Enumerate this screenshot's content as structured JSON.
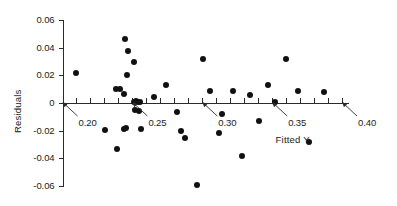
{
  "chart_data": {
    "type": "scatter",
    "title": "",
    "xlabel": "Fitted Y",
    "ylabel": "Residuals",
    "xlim": [
      0.195,
      0.412
    ],
    "ylim": [
      -0.065,
      0.063
    ],
    "grid": false,
    "legend": "none",
    "y_ticks": [
      0.06,
      0.04,
      0.02,
      0,
      -0.02,
      -0.04,
      -0.06
    ],
    "y_tick_labels": [
      "0.06",
      "0.04",
      "0.02",
      "0",
      "-0.02",
      "-0.04",
      "-0.06"
    ],
    "x_tick_step": 0.01,
    "x_ticks": [
      0.2,
      0.21,
      0.22,
      0.23,
      0.24,
      0.25,
      0.26,
      0.27,
      0.28,
      0.29,
      0.3,
      0.31,
      0.32,
      0.33,
      0.34,
      0.35,
      0.36,
      0.37,
      0.38,
      0.39,
      0.4
    ],
    "x_annotations": [
      {
        "label": "0.20",
        "x": 0.2
      },
      {
        "label": "0.25",
        "x": 0.25
      },
      {
        "label": "0.30",
        "x": 0.3
      },
      {
        "label": "0.35",
        "x": 0.35
      },
      {
        "label": "0.40",
        "x": 0.4
      }
    ],
    "zero_reference_line": 0,
    "x": [
      0.2095,
      0.2445,
      0.2472,
      0.2465,
      0.2438,
      0.2408,
      0.2382,
      0.251,
      0.2525,
      0.2538,
      0.2551,
      0.2522,
      0.2548,
      0.2302,
      0.2392,
      0.2438,
      0.2452,
      0.251,
      0.2562,
      0.2658,
      0.2742,
      0.282,
      0.2845,
      0.2878,
      0.2962,
      0.3008,
      0.3052,
      0.312,
      0.314,
      0.3218,
      0.3282,
      0.3342,
      0.3405,
      0.3472,
      0.3522,
      0.36,
      0.3682,
      0.3765,
      0.3872
    ],
    "y": [
      0.0215,
      0.0463,
      0.0375,
      0.02,
      0.0068,
      0.01,
      0.0102,
      0.001,
      0.0012,
      0.0008,
      0.0005,
      -0.0048,
      -0.0058,
      -0.0195,
      -0.033,
      -0.0185,
      -0.0182,
      0.0295,
      -0.0185,
      0.004,
      0.0128,
      -0.0068,
      -0.02,
      -0.025,
      -0.059,
      0.032,
      0.0088,
      -0.0215,
      -0.0082,
      0.0088,
      -0.0382,
      0.006,
      -0.0128,
      0.0128,
      0.001,
      0.0318,
      0.0088,
      -0.0285,
      0.0082
    ],
    "n_points": 39,
    "marker": "filled-circle",
    "marker_color": "#111111"
  },
  "axis": {
    "x_axis_name": "fitted-y-axis",
    "y_axis_name": "residuals-axis"
  }
}
